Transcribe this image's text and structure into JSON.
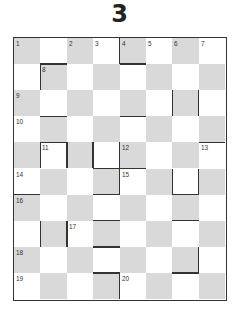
{
  "puzzle": {
    "title": "3",
    "rows": 10,
    "cols": 8,
    "colors": {
      "shaded": "#d9d9d9",
      "plain": "#ffffff",
      "line": "#333333"
    },
    "numbers": [
      {
        "r": 0,
        "c": 0,
        "n": "1"
      },
      {
        "r": 0,
        "c": 2,
        "n": "2"
      },
      {
        "r": 0,
        "c": 3,
        "n": "3"
      },
      {
        "r": 0,
        "c": 4,
        "n": "4"
      },
      {
        "r": 0,
        "c": 5,
        "n": "5"
      },
      {
        "r": 0,
        "c": 6,
        "n": "6"
      },
      {
        "r": 0,
        "c": 7,
        "n": "7"
      },
      {
        "r": 1,
        "c": 1,
        "n": "8"
      },
      {
        "r": 2,
        "c": 0,
        "n": "9"
      },
      {
        "r": 3,
        "c": 0,
        "n": "10"
      },
      {
        "r": 4,
        "c": 1,
        "n": "11"
      },
      {
        "r": 4,
        "c": 4,
        "n": "12"
      },
      {
        "r": 4,
        "c": 7,
        "n": "13"
      },
      {
        "r": 5,
        "c": 0,
        "n": "14"
      },
      {
        "r": 5,
        "c": 4,
        "n": "15"
      },
      {
        "r": 6,
        "c": 0,
        "n": "16"
      },
      {
        "r": 7,
        "c": 2,
        "n": "17"
      },
      {
        "r": 8,
        "c": 0,
        "n": "18"
      },
      {
        "r": 9,
        "c": 0,
        "n": "19"
      },
      {
        "r": 9,
        "c": 4,
        "n": "20"
      }
    ],
    "bars": [
      {
        "r": 0,
        "c": 4,
        "side": "left"
      },
      {
        "r": 0,
        "c": 4,
        "side": "bottom"
      },
      {
        "r": 1,
        "c": 1,
        "side": "top"
      },
      {
        "r": 1,
        "c": 1,
        "side": "left"
      },
      {
        "r": 2,
        "c": 6,
        "side": "left"
      },
      {
        "r": 2,
        "c": 6,
        "side": "right"
      },
      {
        "r": 3,
        "c": 1,
        "side": "top"
      },
      {
        "r": 3,
        "c": 4,
        "side": "top"
      },
      {
        "r": 3,
        "c": 7,
        "side": "bottom"
      },
      {
        "r": 4,
        "c": 1,
        "side": "top"
      },
      {
        "r": 4,
        "c": 1,
        "side": "left"
      },
      {
        "r": 4,
        "c": 1,
        "side": "right"
      },
      {
        "r": 4,
        "c": 3,
        "side": "left"
      },
      {
        "r": 4,
        "c": 3,
        "side": "bottom"
      },
      {
        "r": 4,
        "c": 4,
        "side": "left"
      },
      {
        "r": 5,
        "c": 4,
        "side": "left"
      },
      {
        "r": 5,
        "c": 4,
        "side": "top"
      },
      {
        "r": 5,
        "c": 6,
        "side": "left"
      },
      {
        "r": 5,
        "c": 6,
        "side": "right"
      },
      {
        "r": 5,
        "c": 6,
        "side": "bottom"
      },
      {
        "r": 5,
        "c": 0,
        "side": "bottom"
      },
      {
        "r": 6,
        "c": 3,
        "side": "top"
      },
      {
        "r": 7,
        "c": 1,
        "side": "left"
      },
      {
        "r": 7,
        "c": 1,
        "side": "right"
      },
      {
        "r": 7,
        "c": 3,
        "side": "top"
      },
      {
        "r": 7,
        "c": 6,
        "side": "top"
      },
      {
        "r": 8,
        "c": 3,
        "side": "top"
      },
      {
        "r": 8,
        "c": 6,
        "side": "right"
      },
      {
        "r": 8,
        "c": 6,
        "side": "bottom"
      },
      {
        "r": 9,
        "c": 3,
        "side": "top"
      },
      {
        "r": 9,
        "c": 3,
        "side": "right"
      }
    ]
  }
}
